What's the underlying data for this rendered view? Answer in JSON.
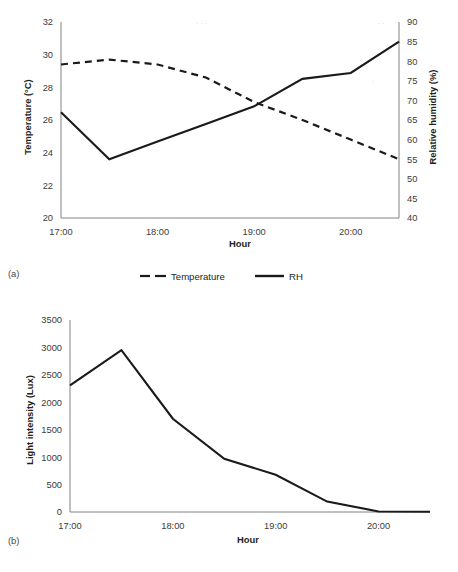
{
  "figure": {
    "panels": [
      {
        "tag": "(a)",
        "type": "dual-axis-line",
        "x_axis_title": "Hour",
        "left_axis_title": "Temperature (°C)",
        "right_axis_title": "Relative humidity (%)",
        "x_tick_labels": [
          "17:00",
          "18:00",
          "19:00",
          "20:00"
        ],
        "left_tick_labels": [
          "32",
          "30",
          "28",
          "26",
          "24",
          "22",
          "20"
        ],
        "right_tick_labels": [
          "90",
          "85",
          "80",
          "75",
          "70",
          "65",
          "60",
          "55",
          "50",
          "45",
          "40"
        ],
        "legend": [
          {
            "label": "Temperature",
            "style": "dashed"
          },
          {
            "label": "RH",
            "style": "solid"
          }
        ]
      },
      {
        "tag": "(b)",
        "type": "line",
        "x_axis_title": "Hour",
        "left_axis_title": "Light intensity (Lux)",
        "x_tick_labels": [
          "17:00",
          "18:00",
          "19:00",
          "20:00"
        ],
        "left_tick_labels": [
          "3500",
          "3000",
          "2500",
          "2000",
          "1500",
          "1000",
          "500",
          "0"
        ]
      }
    ]
  },
  "chart_data": [
    {
      "type": "line",
      "title": "",
      "panel": "(a)",
      "xlabel": "Hour",
      "ylabel": "Temperature (°C)",
      "y2label": "Relative humidity (%)",
      "x": [
        "17:00",
        "17:30",
        "18:00",
        "18:30",
        "19:00",
        "19:30",
        "20:00",
        "20:30"
      ],
      "xlim": [
        "17:00",
        "20:30"
      ],
      "ylim": [
        20,
        32
      ],
      "ytick_step": 2,
      "y2lim": [
        40,
        90
      ],
      "y2tick_step": 5,
      "grid": false,
      "legend_position": "bottom",
      "series": [
        {
          "name": "Temperature",
          "axis": "left",
          "units": "°C",
          "style": "dashed",
          "color": "#1a1a1a",
          "values": [
            29.4,
            29.7,
            29.4,
            28.6,
            27.1,
            26.0,
            24.8,
            23.6
          ]
        },
        {
          "name": "RH",
          "axis": "right",
          "units": "%",
          "style": "solid",
          "color": "#1a1a1a",
          "values": [
            67.0,
            55.0,
            59.5,
            64.0,
            68.5,
            75.5,
            77.0,
            85.0
          ]
        }
      ]
    },
    {
      "type": "line",
      "title": "",
      "panel": "(b)",
      "xlabel": "Hour",
      "ylabel": "Light intensity (Lux)",
      "x": [
        "17:00",
        "17:30",
        "18:00",
        "18:30",
        "19:00",
        "19:30",
        "20:00",
        "20:30"
      ],
      "xlim": [
        "17:00",
        "20:30"
      ],
      "ylim": [
        0,
        3500
      ],
      "ytick_step": 500,
      "grid": false,
      "legend_position": "none",
      "series": [
        {
          "name": "Light intensity",
          "axis": "left",
          "units": "Lux",
          "style": "solid",
          "color": "#1a1a1a",
          "values": [
            2310,
            2950,
            1700,
            970,
            680,
            190,
            10,
            5
          ]
        }
      ]
    }
  ]
}
